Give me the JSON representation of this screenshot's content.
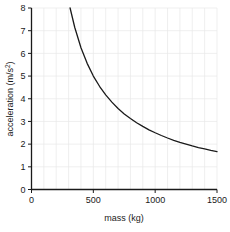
{
  "chart_data": {
    "type": "line",
    "title": "",
    "xlabel": "mass (kg)",
    "ylabel": "acceleration (m/s2)",
    "ylabel_base": "acceleration (m/s",
    "ylabel_sup": "2",
    "ylabel_close": ")",
    "xlim": [
      0,
      1500
    ],
    "ylim": [
      0,
      8
    ],
    "xticks": [
      0,
      500,
      1000,
      1500
    ],
    "xtick_labels": [
      "0",
      "500",
      "1000",
      "1500"
    ],
    "yticks": [
      0,
      1,
      2,
      3,
      4,
      5,
      6,
      7,
      8
    ],
    "ytick_labels": [
      "0",
      "1",
      "2",
      "3",
      "4",
      "5",
      "6",
      "7",
      "8"
    ],
    "grid": true,
    "grid_color": "#e8e8e8",
    "grid_x_step": 100,
    "grid_y_step": 1,
    "legend": "none",
    "line_color": "#1a1a1a",
    "line_width": 1.3,
    "axis_color": "#1a1a1a",
    "background": "#ffffff",
    "relation": "a = 2500 / m",
    "series": [
      {
        "name": "acceleration vs mass",
        "x": [
          312,
          350,
          400,
          450,
          500,
          550,
          600,
          650,
          700,
          750,
          800,
          850,
          900,
          950,
          1000,
          1050,
          1100,
          1150,
          1200,
          1250,
          1300,
          1350,
          1400,
          1450,
          1500
        ],
        "values": [
          8.0,
          7.14,
          6.25,
          5.56,
          5.0,
          4.55,
          4.17,
          3.85,
          3.57,
          3.33,
          3.13,
          2.94,
          2.78,
          2.63,
          2.5,
          2.38,
          2.27,
          2.17,
          2.08,
          2.0,
          1.92,
          1.85,
          1.79,
          1.72,
          1.67
        ]
      }
    ]
  }
}
